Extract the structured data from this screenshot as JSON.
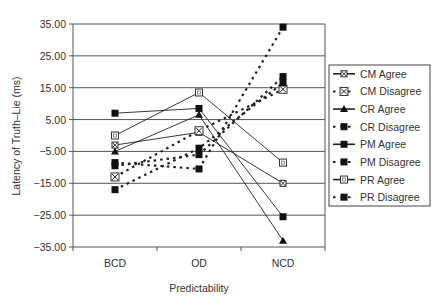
{
  "chart_data": {
    "type": "line",
    "title": "",
    "xlabel": "Predictability",
    "ylabel": "Latency of Truth–Lie (ms)",
    "categories": [
      "BCD",
      "OD",
      "NCD"
    ],
    "ylim": [
      -35,
      35
    ],
    "yticks": [
      35,
      25,
      15,
      5,
      -5,
      -15,
      -25,
      -35
    ],
    "ytick_labels": [
      "35.00",
      "25.00",
      "15.00",
      "5.00",
      "-5.00",
      "-15.00",
      "-25.00",
      "-35.00"
    ],
    "grid": true,
    "legend_position": "right",
    "series": [
      {
        "name": "CM Agree",
        "values": [
          -3,
          1,
          -15
        ],
        "style": "solid",
        "marker": "x-square"
      },
      {
        "name": "CM Disagree",
        "values": [
          -13,
          1.5,
          14.5
        ],
        "style": "dashed",
        "marker": "x-box"
      },
      {
        "name": "CR Agree",
        "values": [
          -5,
          6.5,
          -33
        ],
        "style": "solid",
        "marker": "triangle"
      },
      {
        "name": "CR Disagree",
        "values": [
          -9.5,
          -6,
          18.5
        ],
        "style": "dashed",
        "marker": "square"
      },
      {
        "name": "PM Agree",
        "values": [
          7,
          8.5,
          -25.5
        ],
        "style": "solid",
        "marker": "square"
      },
      {
        "name": "PM Disagree",
        "values": [
          -8.5,
          -10.5,
          34
        ],
        "style": "dashed",
        "marker": "square"
      },
      {
        "name": "PR Agree",
        "values": [
          0,
          13.5,
          -8.5
        ],
        "style": "solid",
        "marker": "open-square"
      },
      {
        "name": "PR Disagree",
        "values": [
          -17,
          -4,
          16.5
        ],
        "style": "dashed",
        "marker": "square"
      }
    ]
  }
}
